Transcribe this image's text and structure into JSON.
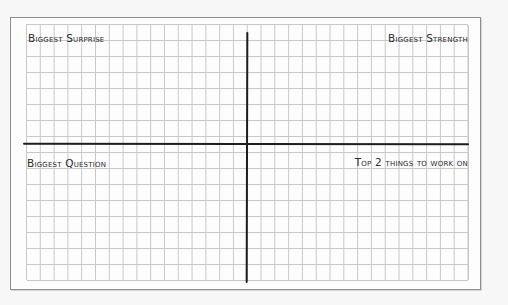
{
  "diagram": {
    "type": "four-quadrant grid worksheet",
    "colors": {
      "background": "#f7f7f7",
      "paper": "#fdfdfd",
      "grid_line": "#c8c8c8",
      "axis_line": "#1e1e1e",
      "text": "#2b2b2b",
      "border": "#8e8e8e"
    },
    "grid": {
      "columns": 32,
      "rows": 16
    },
    "quadrants": {
      "top_left": {
        "label": "Biggest Surprise"
      },
      "top_right": {
        "label": "Biggest Strength"
      },
      "bottom_left": {
        "label": "Biggest Question"
      },
      "bottom_right": {
        "label": "Top 2 things to work on"
      }
    }
  }
}
